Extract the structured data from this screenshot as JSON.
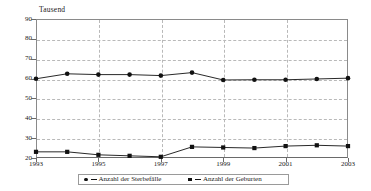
{
  "chart_data": {
    "type": "line",
    "title": "",
    "subtitle": "",
    "xlabel": "",
    "ylabel": "Tausend",
    "unit_label": "Tausend",
    "grid": true,
    "legend_position": "bottom",
    "x": [
      1993,
      1994,
      1995,
      1996,
      1997,
      1998,
      1999,
      2000,
      2001,
      2002,
      2003
    ],
    "xtick_labels": [
      "1993",
      "1995",
      "1997",
      "1999",
      "2001",
      "2003"
    ],
    "xtick_values": [
      1993,
      1995,
      1997,
      1999,
      2001,
      2003
    ],
    "xlim": [
      1993,
      2003
    ],
    "ytick_labels": [
      "20",
      "30",
      "40",
      "50",
      "60",
      "70",
      "80",
      "90"
    ],
    "ytick_values": [
      20,
      30,
      40,
      50,
      60,
      70,
      80,
      90
    ],
    "ylim": [
      20,
      90
    ],
    "series": [
      {
        "name": "Anzahl der Sterbefälle",
        "marker": "circle",
        "color": "#111111",
        "values": [
          59.9,
          62.4,
          62.0,
          62.0,
          61.5,
          63.0,
          59.3,
          59.4,
          59.4,
          59.8,
          60.2
        ]
      },
      {
        "name": "Anzahl der Geburten",
        "marker": "square",
        "color": "#111111",
        "values": [
          23.1,
          23.1,
          21.6,
          21.1,
          20.6,
          25.6,
          25.3,
          25.0,
          26.0,
          26.4,
          26.0
        ]
      }
    ]
  },
  "legend": {
    "entries": [
      {
        "label": "Anzahl der Sterbefälle",
        "marker": "circle"
      },
      {
        "label": "Anzahl der Geburten",
        "marker": "square"
      }
    ]
  },
  "colors": {
    "series": "#111111",
    "grid": "#b9b9b9",
    "axis": "#6a6a6a",
    "background": "#ffffff"
  }
}
